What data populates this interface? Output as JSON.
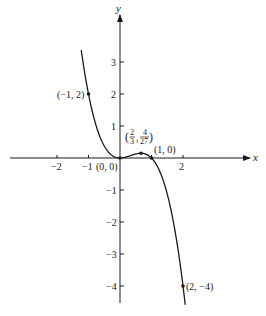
{
  "chart_data": {
    "type": "line",
    "title": "",
    "function": "y = x^2 - x^3",
    "xlabel": "x",
    "ylabel": "y",
    "xlim": [
      -3.8,
      4.2
    ],
    "ylim": [
      -4.6,
      5.0
    ],
    "x_ticks": [
      {
        "value": -2,
        "label": "−2"
      },
      {
        "value": -1,
        "label": "−1"
      },
      {
        "value": 1,
        "label": ""
      },
      {
        "value": 2,
        "label": "2"
      }
    ],
    "y_ticks": [
      {
        "value": 3,
        "label": "3"
      },
      {
        "value": 2,
        "label": "2"
      },
      {
        "value": 1,
        "label": "1"
      },
      {
        "value": -1,
        "label": "−1"
      },
      {
        "value": -2,
        "label": "−2"
      },
      {
        "value": -3,
        "label": "−3"
      },
      {
        "value": -4,
        "label": "−4"
      }
    ],
    "grid": false,
    "curve_x_range": [
      -1.23,
      2.07
    ],
    "points": [
      {
        "x": -1,
        "y": 2,
        "label": "(−1, 2)"
      },
      {
        "x": 0,
        "y": 0,
        "label": "(0, 0)"
      },
      {
        "x": 0.6667,
        "y": 0.1481,
        "label_parts": [
          "2",
          "3",
          "4",
          "27"
        ]
      },
      {
        "x": 1,
        "y": 0,
        "label": "(1, 0)"
      },
      {
        "x": 2,
        "y": -4,
        "label": "(2, −4)"
      }
    ],
    "series": [
      {
        "name": "y = x^2 - x^3",
        "x": [
          -1.23,
          -1.0,
          -0.75,
          -0.5,
          -0.25,
          0,
          0.25,
          0.5,
          0.6667,
          0.75,
          1.0,
          1.25,
          1.5,
          1.75,
          2.0,
          2.07
        ],
        "y": [
          3.37,
          2.0,
          0.98,
          0.375,
          0.078,
          0,
          0.047,
          0.125,
          0.148,
          0.141,
          0,
          -0.39,
          -1.125,
          -2.297,
          -4.0,
          -4.59
        ]
      }
    ]
  },
  "labels": {
    "x_axis": "x",
    "y_axis": "y",
    "pt_neg1_2": "(−1, 2)",
    "pt_origin": "(0, 0)",
    "pt_max_open": "(",
    "pt_max_num1": "2",
    "pt_max_den1": "3",
    "pt_max_comma": ",",
    "pt_max_num2": "4",
    "pt_max_den2": "27",
    "pt_max_close": ")",
    "pt_1_0": "(1, 0)",
    "pt_2_neg4": "(2, −4)",
    "tick_x_neg2": "−2",
    "tick_x_neg1": "−1",
    "tick_x_2": "2",
    "tick_y_3": "3",
    "tick_y_2": "2",
    "tick_y_1": "1",
    "tick_y_neg1": "−1",
    "tick_y_neg2": "−2",
    "tick_y_neg3": "−3",
    "tick_y_neg4": "−4"
  },
  "colors": {
    "ink": "#1a1a1a",
    "background": "#ffffff"
  }
}
